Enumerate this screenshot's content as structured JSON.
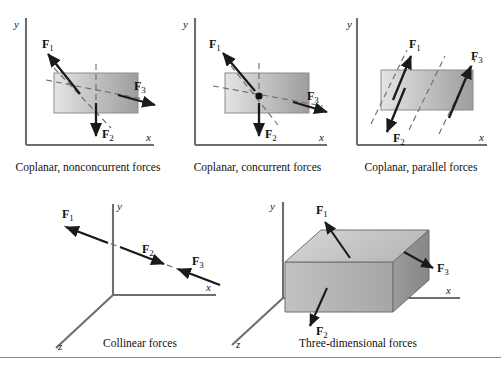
{
  "figure": {
    "kind": "force-systems-diagram",
    "panel_count": 5,
    "force_labels": [
      "F1",
      "F2",
      "F3"
    ],
    "axis_labels": {
      "x": "x",
      "y": "y",
      "z": "z"
    },
    "colors": {
      "ink": "#1a1a1a",
      "axis": "#6e6e6e",
      "dashed": "#6b6b6b",
      "rect_light": "#e2e2e2",
      "rect_dark": "#9a9a9a",
      "box_top": "#c9c9c9",
      "box_front": "#b4b4b4",
      "box_side": "#8f8f8f",
      "rule": "#8a8a8a"
    }
  },
  "panels": [
    {
      "id": "coplanar-nonconcurrent",
      "caption": "Coplanar, nonconcurrent forces",
      "axis_x": "x",
      "axis_y": "y",
      "forces": [
        {
          "label": "F",
          "sub": "1",
          "direction": "up-left"
        },
        {
          "label": "F",
          "sub": "2",
          "direction": "down"
        },
        {
          "label": "F",
          "sub": "3",
          "direction": "right"
        }
      ]
    },
    {
      "id": "coplanar-concurrent",
      "caption": "Coplanar, concurrent forces",
      "axis_x": "x",
      "axis_y": "y",
      "forces": [
        {
          "label": "F",
          "sub": "1",
          "direction": "up-left"
        },
        {
          "label": "F",
          "sub": "2",
          "direction": "down"
        },
        {
          "label": "F",
          "sub": "3",
          "direction": "down-right"
        }
      ]
    },
    {
      "id": "coplanar-parallel",
      "caption": "Coplanar, parallel forces",
      "axis_x": "x",
      "axis_y": "y",
      "forces": [
        {
          "label": "F",
          "sub": "1",
          "direction": "up-right"
        },
        {
          "label": "F",
          "sub": "2",
          "direction": "down-left"
        },
        {
          "label": "F",
          "sub": "3",
          "direction": "up-right"
        }
      ]
    },
    {
      "id": "collinear",
      "caption": "Collinear forces",
      "axis_x": "x",
      "axis_y": "y",
      "axis_z": "z",
      "forces": [
        {
          "label": "F",
          "sub": "1",
          "direction": "left"
        },
        {
          "label": "F",
          "sub": "2",
          "direction": "right"
        },
        {
          "label": "F",
          "sub": "3",
          "direction": "left"
        }
      ]
    },
    {
      "id": "three-dimensional",
      "caption": "Three-dimensional forces",
      "axis_x": "x",
      "axis_y": "y",
      "axis_z": "z",
      "forces": [
        {
          "label": "F",
          "sub": "1",
          "direction": "up-left"
        },
        {
          "label": "F",
          "sub": "2",
          "direction": "down-left"
        },
        {
          "label": "F",
          "sub": "3",
          "direction": "right"
        }
      ]
    }
  ]
}
